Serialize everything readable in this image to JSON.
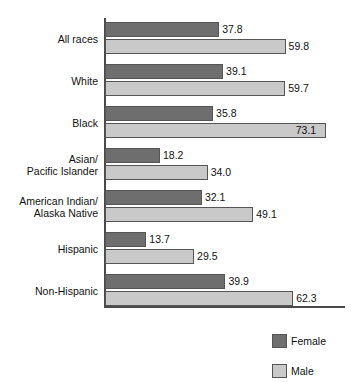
{
  "chart_data": {
    "type": "bar",
    "orientation": "horizontal",
    "title": "",
    "subtitle": "",
    "xlabel": "",
    "ylabel": "",
    "xlim": [
      0,
      80
    ],
    "grid": false,
    "legend_position": "bottom-right",
    "categories": [
      "All races",
      "White",
      "Black",
      "Asian/\nPacific Islander",
      "American Indian/\nAlaska Native",
      "Hispanic",
      "Non-Hispanic"
    ],
    "series": [
      {
        "name": "Female",
        "color": "#6e6e6e",
        "values": [
          37.8,
          39.1,
          35.8,
          18.2,
          32.1,
          13.7,
          39.9
        ],
        "labels": [
          "37.8",
          "39.1",
          "35.8",
          "18.2",
          "32.1",
          "13.7",
          "39.9"
        ]
      },
      {
        "name": "Male",
        "color": "#c9c9c9",
        "values": [
          59.8,
          59.7,
          73.1,
          34.0,
          49.1,
          29.5,
          62.3
        ],
        "labels": [
          "59.8",
          "59.7",
          "73.1",
          "34.0",
          "49.1",
          "29.5",
          "62.3"
        ]
      }
    ]
  },
  "legend": {
    "items": [
      {
        "label": "Female",
        "swatch": "female"
      },
      {
        "label": "Male",
        "swatch": "male"
      }
    ]
  }
}
